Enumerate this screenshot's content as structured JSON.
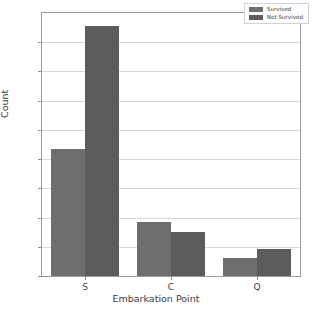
{
  "chart_data": {
    "type": "bar",
    "title": "",
    "xlabel": "Embarkation Point",
    "ylabel": "Count",
    "categories": [
      "S",
      "C",
      "Q"
    ],
    "series": [
      {
        "name": "Survived",
        "values": [
          217,
          93,
          30
        ],
        "color": "#6e6e6e"
      },
      {
        "name": "Not Survived",
        "values": [
          427,
          75,
          47
        ],
        "color": "#5c5c5c"
      }
    ],
    "ylim": [
      0,
      450
    ],
    "yticks": [
      0,
      50,
      100,
      150,
      200,
      250,
      300,
      350,
      400
    ],
    "ytick_labels": [
      "0",
      "50",
      "100",
      "150",
      "200",
      "250",
      "300",
      "350",
      "400"
    ],
    "grid": true,
    "legend_position": "upper right"
  },
  "legend": {
    "entries": [
      {
        "label": "Survived"
      },
      {
        "label": "Not Survived"
      }
    ]
  },
  "axes": {
    "x_title": "Embarkation Point",
    "y_title": "Count"
  }
}
